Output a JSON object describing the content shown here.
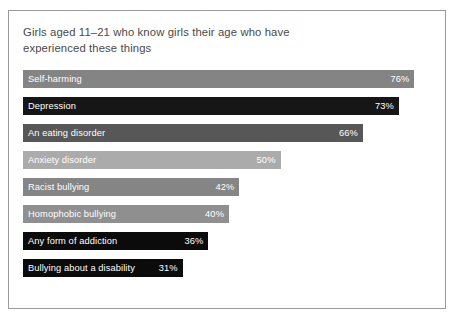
{
  "chart_data": {
    "type": "bar",
    "orientation": "horizontal",
    "title": "Girls aged 11–21 who know girls their age who have experienced these things",
    "xlabel": "",
    "ylabel": "",
    "xlim": [
      0,
      80
    ],
    "grid": false,
    "legend": false,
    "value_suffix": "%",
    "categories": [
      "Self-harming",
      "Depression",
      "An eating disorder",
      "Anxiety disorder",
      "Racist bullying",
      "Homophobic bullying",
      "Any form of addiction",
      "Bullying about a disability"
    ],
    "values": [
      76,
      73,
      66,
      50,
      42,
      40,
      36,
      31
    ],
    "value_labels": [
      "76%",
      "73%",
      "66%",
      "50%",
      "42%",
      "40%",
      "36%",
      "31%"
    ],
    "bars": [
      {
        "label": "Self-harming",
        "value": 76,
        "value_label": "76%",
        "color": "#848484",
        "text_color": "#ffffff"
      },
      {
        "label": "Depression",
        "value": 73,
        "value_label": "73%",
        "color": "#161616",
        "text_color": "#ffffff"
      },
      {
        "label": "An eating disorder",
        "value": 66,
        "value_label": "66%",
        "color": "#575757",
        "text_color": "#ffffff"
      },
      {
        "label": "Anxiety disorder",
        "value": 50,
        "value_label": "50%",
        "color": "#ababab",
        "text_color": "#ffffff"
      },
      {
        "label": "Racist bullying",
        "value": 42,
        "value_label": "42%",
        "color": "#858585",
        "text_color": "#ffffff"
      },
      {
        "label": "Homophobic bullying",
        "value": 40,
        "value_label": "40%",
        "color": "#8f8f8f",
        "text_color": "#ffffff"
      },
      {
        "label": "Any form of addiction",
        "value": 36,
        "value_label": "36%",
        "color": "#0b0b0b",
        "text_color": "#ffffff"
      },
      {
        "label": "Bullying about a disability",
        "value": 31,
        "value_label": "31%",
        "color": "#0b0b0b",
        "text_color": "#ffffff"
      }
    ],
    "colors": {
      "frame_border": "#9a9a9a",
      "background": "#ffffff",
      "title_text": "#4a4a4a"
    }
  }
}
